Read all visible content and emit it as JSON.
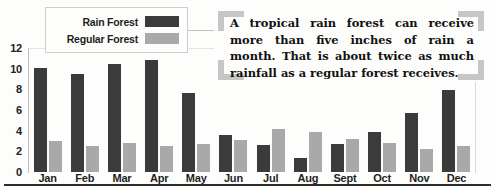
{
  "chart_data": {
    "type": "bar",
    "title": "",
    "xlabel": "",
    "ylabel": "",
    "ylim": [
      0,
      12
    ],
    "grid": false,
    "legend_position": "top-left",
    "categories": [
      "Jan",
      "Feb",
      "Mar",
      "Apr",
      "May",
      "Jun",
      "Jul",
      "Aug",
      "Sept",
      "Oct",
      "Nov",
      "Dec"
    ],
    "yticks": [
      0,
      2,
      4,
      6,
      8,
      10,
      12
    ],
    "series": [
      {
        "name": "Rain Forest",
        "color": "#3b3b3b",
        "values": [
          10.1,
          9.5,
          10.5,
          10.8,
          7.6,
          3.6,
          2.6,
          1.4,
          2.7,
          3.9,
          5.7,
          7.9
        ]
      },
      {
        "name": "Regular Forest",
        "color": "#a9a9a9",
        "values": [
          3.0,
          2.5,
          2.8,
          2.5,
          2.7,
          3.1,
          4.2,
          3.9,
          3.2,
          2.8,
          2.2,
          2.5
        ]
      }
    ],
    "annotation": "A tropical rain forest can receive more than five inches of rain a month. That is about twice as much rainfall as a regular forest receives."
  },
  "legend": {
    "items": [
      {
        "label": "Rain Forest",
        "swatch": "rain"
      },
      {
        "label": "Regular Forest",
        "swatch": "regular"
      }
    ]
  },
  "callout": {
    "text": "A tropical rain forest can receive more than five inches of rain a month. That is about twice as much rainfall as a regular forest receives."
  }
}
